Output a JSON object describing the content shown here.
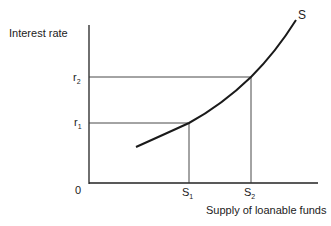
{
  "diagram": {
    "y_axis_label": "Interest rate",
    "x_axis_label": "Supply of loanable funds",
    "origin_label": "0",
    "curve_label": "S",
    "y_ticks": [
      {
        "base": "r",
        "sub": "2"
      },
      {
        "base": "r",
        "sub": "1"
      }
    ],
    "x_ticks": [
      {
        "base": "S",
        "sub": "1"
      },
      {
        "base": "S",
        "sub": "2"
      }
    ],
    "line_color": "#222222"
  }
}
